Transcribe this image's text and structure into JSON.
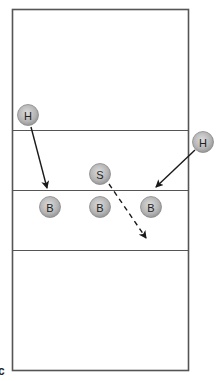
{
  "diagram": {
    "panel_label": "c",
    "players": [
      {
        "id": "hitter-left",
        "label": "H",
        "role": "hitter"
      },
      {
        "id": "hitter-right",
        "label": "H",
        "role": "hitter"
      },
      {
        "id": "setter",
        "label": "S",
        "role": "setter"
      },
      {
        "id": "blocker-left",
        "label": "B",
        "role": "blocker"
      },
      {
        "id": "blocker-middle",
        "label": "B",
        "role": "blocker"
      },
      {
        "id": "blocker-right",
        "label": "B",
        "role": "blocker"
      }
    ],
    "movements": [
      {
        "from": "hitter-left",
        "to": "blocker-left",
        "style": "solid"
      },
      {
        "from": "hitter-right",
        "to": "blocker-right",
        "style": "solid"
      },
      {
        "from": "setter",
        "to": "back-court",
        "style": "dashed"
      }
    ],
    "colors": {
      "court_line": "#555555",
      "arrow": "#1a1a1a",
      "player_fill_light": "#d6d6d6",
      "player_fill_dark": "#9a9a9a",
      "player_text": "#222222"
    }
  }
}
